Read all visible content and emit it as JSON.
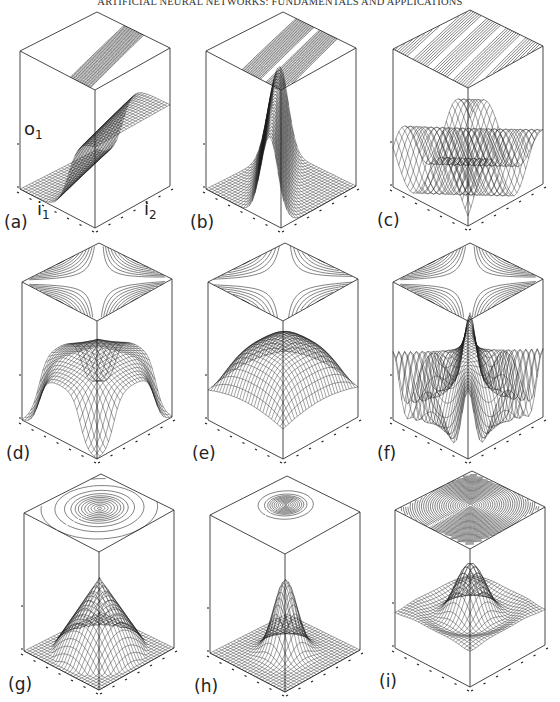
{
  "running_head": "ARTIFICIAL NEURAL NETWORKS: FUNDAMENTALS AND APPLICATIONS",
  "axes": {
    "output": "o",
    "output_sub": "1",
    "input1": "i",
    "input1_sub": "1",
    "input2": "i",
    "input2_sub": "2"
  },
  "panels": [
    {
      "id": "a",
      "label": "(a)",
      "surface": "sigmoid_ridge_step",
      "contour": "diagonal_band_narrow",
      "ox": 0,
      "oy": 0
    },
    {
      "id": "b",
      "label": "(b)",
      "surface": "diagonal_ridge_bump",
      "contour": "diagonal_band_double",
      "ox": 186,
      "oy": 0
    },
    {
      "id": "c",
      "label": "(c)",
      "surface": "sinusoidal_ridges",
      "contour": "diagonal_stripes_full",
      "ox": 373,
      "oy": -2
    },
    {
      "id": "d",
      "label": "(d)",
      "surface": "saddle_plateau",
      "contour": "hyperbolic",
      "ox": 2,
      "oy": 231
    },
    {
      "id": "e",
      "label": "(e)",
      "surface": "saddle_peaks",
      "contour": "hyperbolic_corners",
      "ox": 188,
      "oy": 231
    },
    {
      "id": "f",
      "label": "(f)",
      "surface": "saddle_oscillating",
      "contour": "hyperbolic_dense",
      "ox": 373,
      "oy": 231
    },
    {
      "id": "g",
      "label": "(g)",
      "surface": "radial_cone_peak",
      "contour": "concentric_wide",
      "ox": 4,
      "oy": 462
    },
    {
      "id": "h",
      "label": "(h)",
      "surface": "radial_gaussian_peak",
      "contour": "concentric_tight",
      "ox": 190,
      "oy": 464
    },
    {
      "id": "i",
      "label": "(i)",
      "surface": "radial_sinc_ripple",
      "contour": "concentric_ripple",
      "ox": 375,
      "oy": 459
    }
  ],
  "colors": {
    "ink": "#1a1a1a",
    "frame": "#333333",
    "paper": "#ffffff"
  }
}
